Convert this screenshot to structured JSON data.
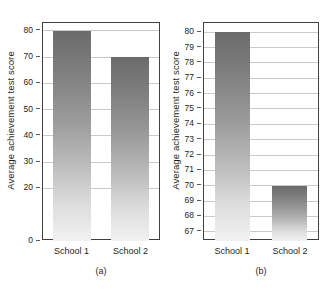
{
  "figure": {
    "background_color": "#ffffff",
    "frame_color": "#414042",
    "gridline_color": "#c9cacc",
    "bar_color_top": "#6b6b6b",
    "bar_color_bottom": "#f2f2f2"
  },
  "panel_a": {
    "caption": "(a)",
    "ylabel": "Average achievement test score",
    "categories": [
      "School 1",
      "School 2"
    ],
    "tick_labels": [
      "0",
      "20",
      "30",
      "40",
      "50",
      "60",
      "70",
      "80"
    ]
  },
  "panel_b": {
    "caption": "(b)",
    "ylabel": "Average achievement test score",
    "categories": [
      "School 1",
      "School 2"
    ],
    "tick_labels": [
      "67",
      "68",
      "69",
      "70",
      "71",
      "72",
      "73",
      "74",
      "75",
      "76",
      "77",
      "78",
      "79",
      "80"
    ]
  },
  "chart_data": [
    {
      "type": "bar",
      "title": "(a)",
      "xlabel": "",
      "ylabel": "Average achievement test score",
      "categories": [
        "School 1",
        "School 2"
      ],
      "values": [
        80,
        70
      ],
      "ylim": [
        0,
        83
      ],
      "yticks": [
        0,
        20,
        30,
        40,
        50,
        60,
        70,
        80
      ],
      "ytick_labels": [
        "0",
        "20",
        "30",
        "40",
        "50",
        "60",
        "70",
        "80"
      ],
      "grid": true,
      "legend": false,
      "note": "Full zero-based axis; the ten-point difference appears small."
    },
    {
      "type": "bar",
      "title": "(b)",
      "xlabel": "",
      "ylabel": "Average achievement test score",
      "categories": [
        "School 1",
        "School 2"
      ],
      "values": [
        80,
        70
      ],
      "ylim": [
        66.4,
        80.6
      ],
      "yticks": [
        67,
        68,
        69,
        70,
        71,
        72,
        73,
        74,
        75,
        76,
        77,
        78,
        79,
        80
      ],
      "ytick_labels": [
        "67",
        "68",
        "69",
        "70",
        "71",
        "72",
        "73",
        "74",
        "75",
        "76",
        "77",
        "78",
        "79",
        "80"
      ],
      "grid": true,
      "legend": false,
      "note": "Truncated axis starting near 67; the same ten-point difference appears large."
    }
  ]
}
